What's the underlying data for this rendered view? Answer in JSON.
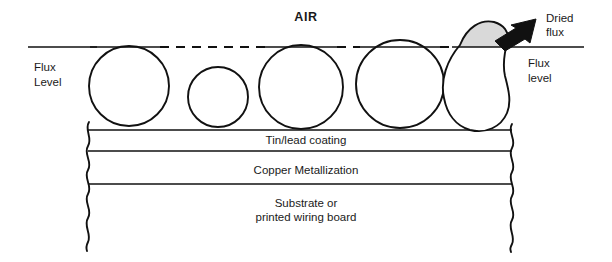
{
  "diagram": {
    "title_label": "AIR",
    "flux_level_left": {
      "line1": "Flux",
      "line2": "Level"
    },
    "flux_level_right": {
      "line1": "Flux",
      "line2": "level"
    },
    "callout": {
      "line1": "Dried",
      "line2": "flux"
    },
    "layers": [
      {
        "id": "tin-lead",
        "label": "Tin/lead coating"
      },
      {
        "id": "copper",
        "label": "Copper Metallization"
      },
      {
        "id": "substrate",
        "label_line1": "Substrate or",
        "label_line2": "printed wiring board"
      }
    ],
    "colors": {
      "outline": "#111111",
      "dried_flux_fill": "#d9d9d9",
      "background": "#ffffff",
      "text": "#1a1a1a"
    },
    "icons": {
      "callout_arrow": "arrow-down-left-icon",
      "left_break": "wavy-break-icon",
      "right_break": "wavy-break-icon"
    },
    "flux_line_y": 47,
    "solder_balls": [
      {
        "id": "ball-1",
        "cx": 129,
        "cy": 86,
        "r": 41,
        "dried_flux": true
      },
      {
        "id": "ball-2",
        "cx": 218,
        "cy": 96,
        "r": 31,
        "dried_flux": false
      },
      {
        "id": "ball-3",
        "cx": 301,
        "cy": 87,
        "r": 43,
        "dried_flux": true
      },
      {
        "id": "ball-4",
        "cx": 400,
        "cy": 84,
        "r": 45,
        "dried_flux": true
      },
      {
        "id": "ball-5-deformed",
        "cx": 478,
        "cy": 80,
        "r": 44,
        "dried_flux": true
      }
    ]
  }
}
